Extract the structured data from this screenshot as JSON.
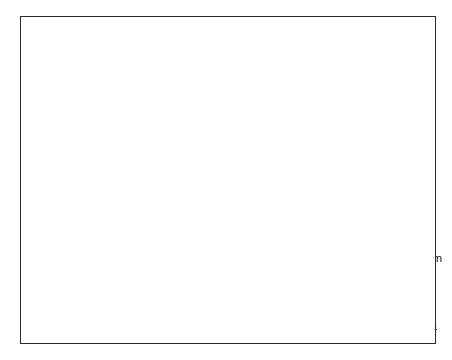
{
  "chart_data": {
    "type": "line",
    "title": "",
    "xlabel": "",
    "ylabel": "",
    "ylim": [
      50,
      110
    ],
    "yticks": [
      50,
      60,
      70,
      80,
      90,
      100,
      110
    ],
    "ytick_labels": [
      "50",
      "60",
      "70",
      "80",
      "90",
      "100",
      "110"
    ],
    "grid": false,
    "legend_position": "lower right",
    "x": [
      "1960/2",
      "1960/3",
      "1960/4",
      "1961/1",
      "1961/2",
      "1961/3",
      "1961/4",
      "1962/1",
      "1962/2",
      "1962/3",
      "1962/4",
      "1963/1",
      "1963/2",
      "1963/3",
      "1963/4",
      "1964/1",
      "1964/2",
      "1964/3",
      "1964/4",
      "1965/1",
      "1965/2",
      "1965/3",
      "1965/4",
      "1966/1",
      "1966/2",
      "1966/3",
      "1966/4",
      "1967/1",
      "1967/2",
      "1967/3",
      "1967/4",
      "1968/1",
      "1968/2",
      "1968/3",
      "1968/4",
      "1969/1",
      "1969/2",
      "1969/3",
      "1969/4"
    ],
    "xtick_labels": [
      "1960/2",
      "1962/2",
      "1964/2",
      "1966/2",
      "1968/2",
      "1969/4"
    ],
    "xtick_indices": [
      0,
      8,
      16,
      24,
      32,
      38
    ],
    "minor_tick_every": 2,
    "series": [
      {
        "name": "Actual Level",
        "style": "solid",
        "color": "#1a1a1a",
        "values": [
          55.0,
          52.0,
          55.5,
          63.5,
          63.5,
          65.5,
          70.0,
          68.5,
          53.5,
          54.0,
          69.0,
          66.0,
          68.0,
          71.5,
          74.5,
          78.0,
          81.0,
          83.0,
          83.5,
          85.0,
          82.5,
          84.0,
          87.0,
          91.0,
          85.5,
          75.5,
          80.0,
          89.0,
          89.5,
          95.0,
          95.0,
          89.0,
          98.0,
          103.0,
          100.0,
          96.5,
          93.5,
          91.0,
          90.0
        ]
      },
      {
        "name": "Level Predicted by System",
        "style": "dotted",
        "color": "#4a4a4a",
        "values": [
          54.0,
          53.0,
          53.0,
          62.5,
          63.5,
          66.0,
          71.0,
          72.0,
          70.0,
          54.0,
          56.0,
          68.5,
          68.0,
          71.5,
          75.0,
          78.5,
          81.0,
          83.5,
          86.0,
          85.0,
          86.5,
          86.0,
          88.5,
          93.0,
          96.0,
          90.0,
          79.5,
          83.0,
          94.0,
          93.5,
          90.5,
          93.5,
          97.5,
          103.5,
          107.0,
          101.5,
          98.5,
          97.5,
          94.0
        ]
      },
      {
        "name": "Level Predicted by Naive (No–Change) Model",
        "style": "dashed",
        "color": "#1a1a1a",
        "values": [
          55.0,
          56.0,
          53.0,
          55.5,
          63.5,
          63.5,
          65.5,
          70.0,
          71.0,
          53.5,
          54.0,
          55.5,
          66.0,
          68.0,
          71.5,
          74.5,
          78.0,
          81.0,
          83.0,
          83.5,
          85.0,
          82.5,
          84.0,
          87.0,
          92.0,
          89.0,
          80.0,
          76.0,
          85.5,
          89.5,
          95.5,
          95.5,
          89.5,
          97.5,
          104.0,
          101.0,
          98.5,
          95.5,
          93.0
        ]
      }
    ],
    "legend": [
      {
        "label": "Actual Level",
        "style": "solid"
      },
      {
        "label": "Level Predicted by System",
        "style": "dotted"
      },
      {
        "label": "Level Predicted by Naive",
        "style": "dashed"
      },
      {
        "label": "(No–Change) Model",
        "style": "none"
      }
    ]
  }
}
